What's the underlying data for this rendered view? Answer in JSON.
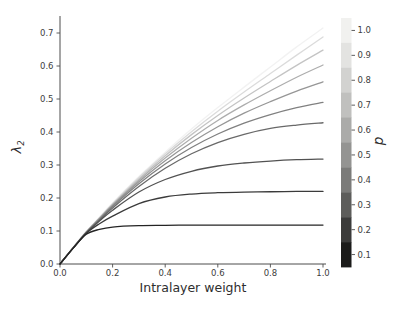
{
  "figure": {
    "background": "#ffffff",
    "width": 406,
    "height": 312
  },
  "chart_data": {
    "type": "line",
    "title": "",
    "xlabel": "Intralayer weight",
    "ylabel": "λ2",
    "ylabel_base": "λ",
    "ylabel_sub": "2",
    "xlim": [
      0.0,
      1.0
    ],
    "ylim": [
      0.0,
      0.75
    ],
    "grid": false,
    "legend_position": "colorbar-right",
    "x_tick_labels": [
      "0.0",
      "0.2",
      "0.4",
      "0.6",
      "0.8",
      "1.0"
    ],
    "x_tick_values": [
      0.0,
      0.2,
      0.4,
      0.6,
      0.8,
      1.0
    ],
    "y_tick_labels": [
      "0.0",
      "0.1",
      "0.2",
      "0.3",
      "0.4",
      "0.5",
      "0.6",
      "0.7"
    ],
    "y_tick_values": [
      0.0,
      0.1,
      0.2,
      0.3,
      0.4,
      0.5,
      0.6,
      0.7
    ],
    "x": [
      0.0,
      0.05,
      0.1,
      0.15,
      0.2,
      0.3,
      0.4,
      0.5,
      0.6,
      0.7,
      0.8,
      0.9,
      1.0
    ],
    "series": [
      {
        "name": "p = 1.0",
        "p": 1.0,
        "color": "#f2f2f2",
        "values": [
          0.0,
          0.05,
          0.098,
          0.142,
          0.185,
          0.265,
          0.339,
          0.409,
          0.474,
          0.536,
          0.597,
          0.658,
          0.715
        ]
      },
      {
        "name": "p = 0.9",
        "p": 0.9,
        "color": "#dbdbdb",
        "values": [
          0.0,
          0.05,
          0.098,
          0.14,
          0.183,
          0.262,
          0.334,
          0.401,
          0.463,
          0.521,
          0.577,
          0.633,
          0.688
        ]
      },
      {
        "name": "p = 0.8",
        "p": 0.8,
        "color": "#c4c4c4",
        "values": [
          0.0,
          0.049,
          0.097,
          0.139,
          0.181,
          0.258,
          0.328,
          0.392,
          0.45,
          0.503,
          0.553,
          0.602,
          0.648
        ]
      },
      {
        "name": "p = 0.7",
        "p": 0.7,
        "color": "#adadad",
        "values": [
          0.0,
          0.049,
          0.097,
          0.138,
          0.179,
          0.254,
          0.321,
          0.381,
          0.435,
          0.482,
          0.525,
          0.566,
          0.603
        ]
      },
      {
        "name": "p = 0.6",
        "p": 0.6,
        "color": "#969696",
        "values": [
          0.0,
          0.049,
          0.096,
          0.137,
          0.177,
          0.249,
          0.313,
          0.368,
          0.416,
          0.457,
          0.492,
          0.524,
          0.552
        ]
      },
      {
        "name": "p = 0.5",
        "p": 0.5,
        "color": "#808080",
        "values": [
          0.0,
          0.049,
          0.096,
          0.135,
          0.174,
          0.243,
          0.303,
          0.353,
          0.394,
          0.427,
          0.453,
          0.474,
          0.49
        ]
      },
      {
        "name": "p = 0.4",
        "p": 0.4,
        "color": "#696969",
        "values": [
          0.0,
          0.049,
          0.095,
          0.133,
          0.17,
          0.235,
          0.29,
          0.334,
          0.368,
          0.393,
          0.411,
          0.421,
          0.428
        ]
      },
      {
        "name": "p = 0.3",
        "p": 0.3,
        "color": "#525252",
        "values": [
          0.0,
          0.048,
          0.094,
          0.13,
          0.163,
          0.218,
          0.256,
          0.281,
          0.297,
          0.306,
          0.312,
          0.316,
          0.318
        ]
      },
      {
        "name": "p = 0.2",
        "p": 0.2,
        "color": "#3b3b3b",
        "values": [
          0.0,
          0.048,
          0.093,
          0.122,
          0.145,
          0.183,
          0.203,
          0.212,
          0.216,
          0.218,
          0.219,
          0.22,
          0.22
        ]
      },
      {
        "name": "p = 0.1",
        "p": 0.1,
        "color": "#242424",
        "values": [
          0.0,
          0.048,
          0.09,
          0.105,
          0.112,
          0.116,
          0.117,
          0.118,
          0.118,
          0.118,
          0.118,
          0.118,
          0.118
        ]
      }
    ],
    "colorbar": {
      "label": "p",
      "tick_labels_top_to_bottom": [
        "1.0",
        "0.9",
        "0.8",
        "0.7",
        "0.6",
        "0.5",
        "0.4",
        "0.3",
        "0.2",
        "0.1"
      ],
      "block_colors_top_to_bottom": [
        "#f1f1ef",
        "#e3e3e1",
        "#d2d2d0",
        "#c0c0be",
        "#ababa9",
        "#949492",
        "#7b7b79",
        "#5d5d5b",
        "#3b3b3a",
        "#1b1b1a"
      ]
    },
    "style_colors": {
      "spine": "#4d4d4d",
      "tick_label": "#3d3d3d",
      "axis_label": "#2e2e2e"
    }
  }
}
